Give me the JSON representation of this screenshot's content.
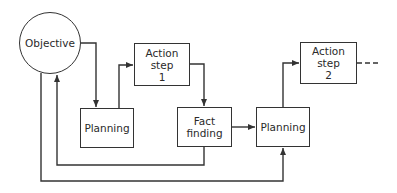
{
  "diagram": {
    "type": "flowchart",
    "nodes": {
      "objective": {
        "label": "Objective",
        "shape": "circle"
      },
      "planning_1": {
        "label": "Planning",
        "shape": "rectangle"
      },
      "action_step_1": {
        "label": "Action\nstep\n1",
        "shape": "rectangle"
      },
      "fact_finding": {
        "label": "Fact\nfinding",
        "shape": "rectangle"
      },
      "planning_2": {
        "label": "Planning",
        "shape": "rectangle"
      },
      "action_step_2": {
        "label": "Action\nstep\n2",
        "shape": "rectangle"
      }
    },
    "edges": [
      {
        "from": "objective",
        "to": "planning_1",
        "style": "solid"
      },
      {
        "from": "planning_1",
        "to": "action_step_1",
        "style": "solid"
      },
      {
        "from": "action_step_1",
        "to": "fact_finding",
        "style": "solid"
      },
      {
        "from": "fact_finding",
        "to": "planning_2",
        "style": "solid"
      },
      {
        "from": "planning_2",
        "to": "action_step_2",
        "style": "solid"
      },
      {
        "from": "fact_finding",
        "to": "objective",
        "style": "solid",
        "note": "feedback loop"
      },
      {
        "from": "objective",
        "to": "planning_2",
        "style": "solid",
        "note": "outer loop"
      },
      {
        "from": "action_step_2",
        "to": "continuation",
        "style": "dashed"
      }
    ],
    "colors": {
      "line": "#333333",
      "background": "#ffffff"
    }
  }
}
